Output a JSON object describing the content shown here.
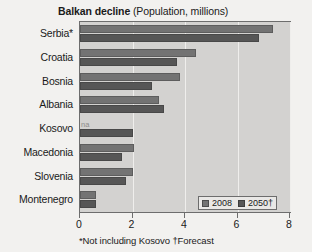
{
  "title": {
    "main": "Balkan decline",
    "sub": " (Population, millions)"
  },
  "footnote": "*Not including Kosovo †Forecast",
  "legend": {
    "items": [
      {
        "label": "2008",
        "color": "#737373"
      },
      {
        "label": "2050†",
        "color": "#565656"
      }
    ]
  },
  "chart_data": {
    "type": "bar",
    "orientation": "horizontal",
    "title": "Balkan decline (Population, millions)",
    "xlabel": "",
    "ylabel": "",
    "xlim": [
      0,
      8
    ],
    "xticks": [
      "0",
      "2",
      "4",
      "6",
      "8"
    ],
    "grid": true,
    "legend_position": "bottom-right",
    "categories": [
      "Serbia*",
      "Croatia",
      "Bosnia",
      "Albania",
      "Kosovo",
      "Macedonia",
      "Slovenia",
      "Montenegro"
    ],
    "series": [
      {
        "name": "2008",
        "color": "#737373",
        "values": [
          7.35,
          4.4,
          3.8,
          3.0,
          null,
          2.05,
          2.0,
          0.6
        ],
        "value_labels": [
          "",
          "",
          "",
          "",
          "na",
          "",
          "",
          ""
        ]
      },
      {
        "name": "2050†",
        "color": "#565656",
        "values": [
          6.8,
          3.7,
          2.75,
          3.2,
          2.0,
          1.6,
          1.75,
          0.6
        ],
        "value_labels": [
          "",
          "",
          "",
          "",
          "",
          "",
          "",
          ""
        ]
      }
    ],
    "annotations": [
      {
        "category": "Kosovo",
        "series": "2008",
        "text": "na"
      }
    ]
  }
}
